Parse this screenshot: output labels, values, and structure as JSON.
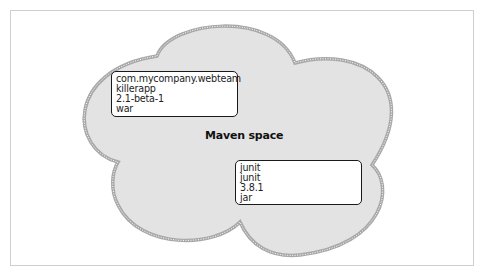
{
  "diagram": {
    "space_label": "Maven space",
    "colors": {
      "cloud_fill": "#e3e3e3",
      "cloud_border": "#a8a8a8",
      "box_border": "#1a1a1a",
      "frame_border": "#cfcfcf"
    },
    "artifacts": [
      {
        "groupId": "com.mycompany.webteam",
        "artifactId": "killerapp",
        "version": "2.1-beta-1",
        "packaging": "war"
      },
      {
        "groupId": "junit",
        "artifactId": "junit",
        "version": "3.8.1",
        "packaging": "jar"
      }
    ]
  }
}
